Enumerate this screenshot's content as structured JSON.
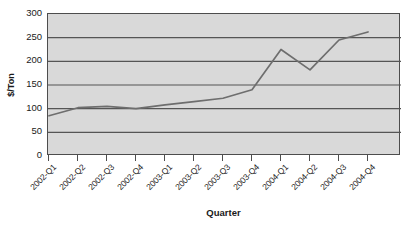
{
  "chart_data": {
    "type": "line",
    "title": "",
    "xlabel": "Quarter",
    "ylabel": "$/Ton",
    "categories": [
      "2002-Q1",
      "2002-Q2",
      "2002-Q3",
      "2002-Q4",
      "2003-Q1",
      "2003-Q2",
      "2003-Q3",
      "2003-Q4",
      "2004-Q1",
      "2004-Q2",
      "2004-Q3",
      "2004-Q4"
    ],
    "values": [
      85,
      102,
      105,
      100,
      108,
      115,
      122,
      140,
      225,
      182,
      245,
      262
    ],
    "series": [
      {
        "name": "$/Ton",
        "values": [
          85,
          102,
          105,
          100,
          108,
          115,
          122,
          140,
          225,
          182,
          245,
          262
        ]
      }
    ],
    "ylim": [
      0,
      300
    ],
    "ytick_values": [
      0,
      50,
      100,
      150,
      200,
      250,
      300
    ],
    "ytick_labels": [
      "0",
      "50",
      "100",
      "150",
      "200",
      "250",
      "300"
    ],
    "grid": "horizontal",
    "legend": "none",
    "colors": {
      "plot_background": "#d9d9d9",
      "gridline": "#555555",
      "line": "#6e6e6e",
      "axis": "#4d4d4d",
      "text": "#1a1a1a",
      "page_background": "#ffffff"
    }
  }
}
